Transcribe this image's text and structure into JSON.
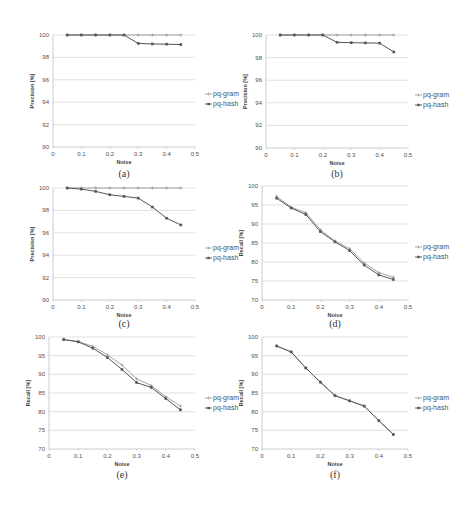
{
  "figure": {
    "top_strip_text": "",
    "legend": [
      "pq-gram",
      "pq-hash"
    ],
    "xlabel": "Noise",
    "colors": {
      "pq_gram": "#9a9a9a",
      "pq_hash": "#555555",
      "grid": "#d9d9d9",
      "axis": "#bfbfbf"
    }
  },
  "chart_data": [
    {
      "id": "a",
      "caption": "(a)",
      "type": "line",
      "title": "",
      "xlabel": "Noise",
      "ylabel": "Precision [%]",
      "x": [
        0.05,
        0.1,
        0.15,
        0.2,
        0.25,
        0.3,
        0.35,
        0.4,
        0.45
      ],
      "xticks": [
        "0",
        "0.1",
        "0.2",
        "0.3",
        "0.4",
        "0.5"
      ],
      "yticks": [
        "90",
        "92",
        "94",
        "96",
        "98",
        "100"
      ],
      "ylim": [
        90,
        100
      ],
      "xlim": [
        0,
        0.5
      ],
      "grid": true,
      "legend_position": "right",
      "series": [
        {
          "name": "pq-gram",
          "values": [
            100,
            100,
            100,
            100,
            100,
            100,
            100,
            100,
            100
          ]
        },
        {
          "name": "pq-hash",
          "values": [
            100,
            100,
            100,
            100,
            100,
            99.25,
            99.2,
            99.18,
            99.15
          ]
        }
      ]
    },
    {
      "id": "b",
      "caption": "(b)",
      "type": "line",
      "title": "",
      "xlabel": "Noise",
      "ylabel": "Precision [%]",
      "x": [
        0.05,
        0.1,
        0.15,
        0.2,
        0.25,
        0.3,
        0.35,
        0.4,
        0.45
      ],
      "xticks": [
        "0",
        "0.1",
        "0.2",
        "0.3",
        "0.4",
        "0.5"
      ],
      "yticks": [
        "90",
        "92",
        "94",
        "96",
        "98",
        "100"
      ],
      "ylim": [
        90,
        100
      ],
      "xlim": [
        0,
        0.5
      ],
      "grid": true,
      "legend_position": "right",
      "series": [
        {
          "name": "pq-gram",
          "values": [
            100,
            100,
            100,
            100,
            100,
            100,
            100,
            100,
            100
          ]
        },
        {
          "name": "pq-hash",
          "values": [
            100,
            100,
            100,
            100,
            99.35,
            99.32,
            99.3,
            99.28,
            98.5
          ]
        }
      ]
    },
    {
      "id": "c",
      "caption": "(c)",
      "type": "line",
      "title": "",
      "xlabel": "Noise",
      "ylabel": "Precision [%]",
      "x": [
        0.05,
        0.1,
        0.15,
        0.2,
        0.25,
        0.3,
        0.35,
        0.4,
        0.45
      ],
      "xticks": [
        "0",
        "0.1",
        "0.2",
        "0.3",
        "0.4",
        "0.5"
      ],
      "yticks": [
        "90",
        "92",
        "94",
        "96",
        "98",
        "100"
      ],
      "ylim": [
        90,
        100
      ],
      "xlim": [
        0,
        0.5
      ],
      "grid": true,
      "legend_position": "right",
      "series": [
        {
          "name": "pq-gram",
          "values": [
            100,
            100,
            100,
            100,
            100,
            100,
            100,
            100,
            100
          ]
        },
        {
          "name": "pq-hash",
          "values": [
            100,
            99.9,
            99.7,
            99.4,
            99.25,
            99.1,
            98.3,
            97.3,
            96.7
          ]
        }
      ]
    },
    {
      "id": "d",
      "caption": "(d)",
      "type": "line",
      "title": "",
      "xlabel": "Noise",
      "ylabel": "Recall [%]",
      "x": [
        0.05,
        0.1,
        0.15,
        0.2,
        0.25,
        0.3,
        0.35,
        0.4,
        0.45
      ],
      "xticks": [
        "0",
        "0.1",
        "0.2",
        "0.3",
        "0.4",
        "0.5"
      ],
      "yticks": [
        "70",
        "75",
        "80",
        "85",
        "90",
        "95",
        "100"
      ],
      "ylim": [
        70,
        100
      ],
      "xlim": [
        0,
        0.5
      ],
      "grid": true,
      "legend_position": "right",
      "series": [
        {
          "name": "pq-gram",
          "values": [
            97.3,
            94.4,
            93.0,
            88.5,
            85.5,
            83.5,
            79.8,
            77.2,
            76.0
          ]
        },
        {
          "name": "pq-hash",
          "values": [
            96.8,
            94.2,
            92.5,
            88.0,
            85.3,
            83.0,
            79.2,
            76.6,
            75.4
          ]
        }
      ]
    },
    {
      "id": "e",
      "caption": "(e)",
      "type": "line",
      "title": "",
      "xlabel": "Noise",
      "ylabel": "Recall [%]",
      "x": [
        0.05,
        0.1,
        0.15,
        0.2,
        0.25,
        0.3,
        0.35,
        0.4,
        0.45
      ],
      "xticks": [
        "0",
        "0.1",
        "0.2",
        "0.3",
        "0.4",
        "0.5"
      ],
      "yticks": [
        "70",
        "75",
        "80",
        "85",
        "90",
        "95",
        "100"
      ],
      "ylim": [
        70,
        100
      ],
      "xlim": [
        0,
        0.5
      ],
      "grid": true,
      "legend_position": "right",
      "series": [
        {
          "name": "pq-gram",
          "values": [
            99.4,
            98.8,
            97.5,
            95.2,
            92.5,
            88.8,
            87.0,
            84.0,
            81.5
          ]
        },
        {
          "name": "pq-hash",
          "values": [
            99.3,
            98.7,
            97.0,
            94.5,
            91.3,
            87.8,
            86.5,
            83.5,
            80.5
          ]
        }
      ]
    },
    {
      "id": "f",
      "caption": "(f)",
      "type": "line",
      "title": "",
      "xlabel": "Noise",
      "ylabel": "Recall [%]",
      "x": [
        0.05,
        0.1,
        0.15,
        0.2,
        0.25,
        0.3,
        0.35,
        0.4,
        0.45
      ],
      "xticks": [
        "0",
        "0.1",
        "0.2",
        "0.3",
        "0.4",
        "0.5"
      ],
      "yticks": [
        "70",
        "75",
        "80",
        "85",
        "90",
        "95",
        "100"
      ],
      "ylim": [
        70,
        100
      ],
      "xlim": [
        0,
        0.5
      ],
      "grid": true,
      "legend_position": "right",
      "series": [
        {
          "name": "pq-gram",
          "values": [
            97.6,
            96.0,
            91.7,
            87.9,
            84.3,
            82.9,
            81.5,
            77.6,
            73.9
          ]
        },
        {
          "name": "pq-hash",
          "values": [
            97.6,
            96.0,
            91.7,
            87.9,
            84.3,
            82.9,
            81.5,
            77.6,
            73.9
          ]
        }
      ]
    }
  ],
  "layout": [
    {
      "id": "a",
      "x0": 53,
      "x1": 195,
      "ytop": 35,
      "ybot": 147,
      "legx": 205,
      "legy": 94,
      "capy": 177
    },
    {
      "id": "b",
      "x0": 266,
      "x1": 408,
      "ytop": 35,
      "ybot": 148,
      "legx": 415,
      "legy": 95,
      "capy": 177
    },
    {
      "id": "c",
      "x0": 53,
      "x1": 195,
      "ytop": 188,
      "ybot": 300,
      "legx": 205,
      "legy": 248,
      "capy": 327
    },
    {
      "id": "d",
      "x0": 262,
      "x1": 408,
      "ytop": 186,
      "ybot": 300,
      "legx": 415,
      "legy": 247,
      "capy": 327
    },
    {
      "id": "e",
      "x0": 49,
      "x1": 195,
      "ytop": 337,
      "ybot": 449,
      "legx": 205,
      "legy": 398,
      "capy": 478
    },
    {
      "id": "f",
      "x0": 262,
      "x1": 408,
      "ytop": 337,
      "ybot": 449,
      "legx": 415,
      "legy": 398,
      "capy": 478
    }
  ]
}
